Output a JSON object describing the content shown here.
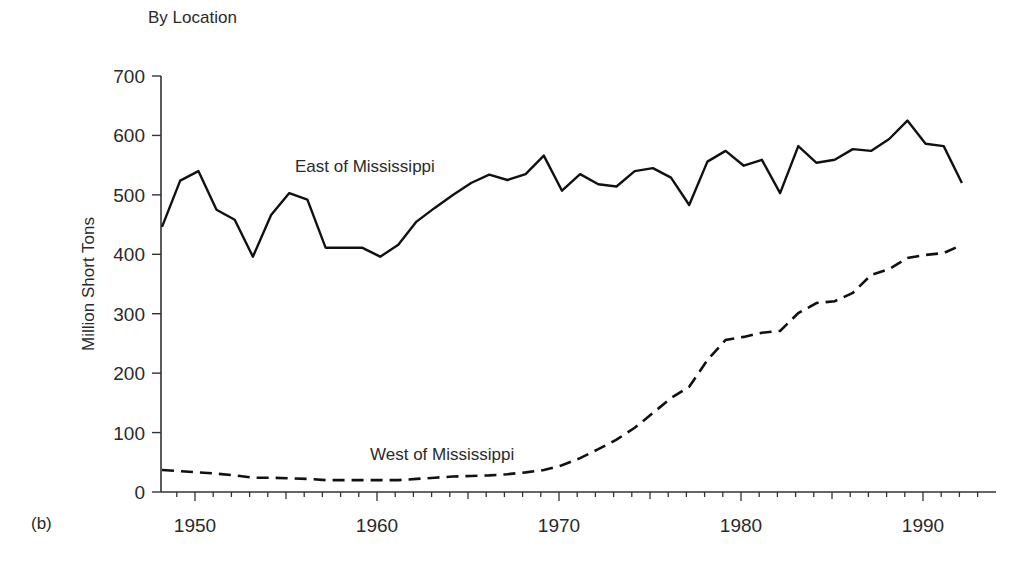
{
  "figure": {
    "panel_title": "By Location",
    "panel_tag": "(b)",
    "ylabel": "Million Short Tons",
    "ytick_labels": [
      "0",
      "100",
      "200",
      "300",
      "400",
      "500",
      "600",
      "700"
    ],
    "xtick_labels": [
      "1950",
      "1960",
      "1970",
      "1980",
      "1990"
    ],
    "series_labels": {
      "east": "East of Mississippi",
      "west": "West of Mississippi"
    },
    "colors": {
      "line": "#111111",
      "axis": "#333333",
      "text": "#2a2a2a",
      "background": "#ffffff"
    }
  },
  "chart_data": {
    "type": "line",
    "title": "By Location",
    "panel": "(b)",
    "xlabel": "",
    "ylabel": "Million Short Tons",
    "ylim": [
      0,
      700
    ],
    "xlim": [
      1948,
      1993
    ],
    "yticks": [
      0,
      100,
      200,
      300,
      400,
      500,
      600,
      700
    ],
    "xticks": [
      1950,
      1960,
      1970,
      1980,
      1990
    ],
    "grid": false,
    "legend": "inline labels",
    "x": [
      1948,
      1949,
      1950,
      1951,
      1952,
      1953,
      1954,
      1955,
      1956,
      1957,
      1958,
      1959,
      1960,
      1961,
      1962,
      1963,
      1964,
      1965,
      1966,
      1967,
      1968,
      1969,
      1970,
      1971,
      1972,
      1973,
      1974,
      1975,
      1976,
      1977,
      1978,
      1979,
      1980,
      1981,
      1982,
      1983,
      1984,
      1985,
      1986,
      1987,
      1988,
      1989,
      1990,
      1991,
      1992,
      1993
    ],
    "series": [
      {
        "name": "East of Mississippi",
        "style": "solid",
        "values": [
          446,
          524,
          540,
          475,
          458,
          396,
          466,
          503,
          492,
          411,
          411,
          411,
          396,
          416,
          455,
          478,
          500,
          520,
          534,
          525,
          535,
          566,
          507,
          535,
          518,
          514,
          540,
          545,
          529,
          483,
          556,
          574,
          549,
          559,
          503,
          582,
          554,
          559,
          577,
          574,
          594,
          625,
          586,
          582,
          520,
          520
        ]
      },
      {
        "name": "West of Mississippi",
        "style": "dashed",
        "values": [
          37,
          35,
          33,
          31,
          28,
          24,
          24,
          23,
          22,
          20,
          20,
          20,
          20,
          20,
          22,
          24,
          26,
          27,
          28,
          30,
          33,
          37,
          45,
          57,
          72,
          88,
          108,
          133,
          158,
          177,
          222,
          256,
          261,
          268,
          271,
          301,
          318,
          321,
          335,
          365,
          375,
          394,
          399,
          402,
          416,
          416
        ]
      }
    ]
  }
}
